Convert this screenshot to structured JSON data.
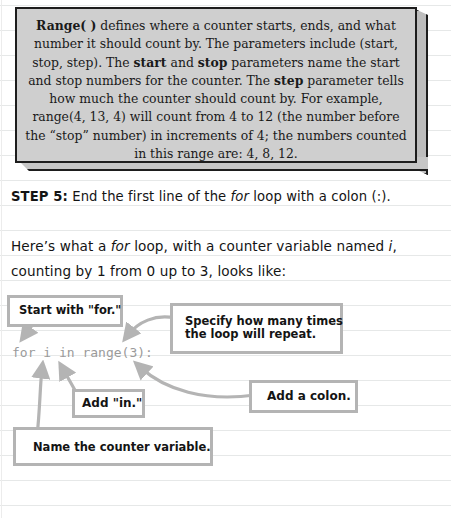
{
  "info_box": {
    "segments": [
      {
        "text": "Range( )",
        "bold": true
      },
      {
        "text": " defines where a counter starts, ends, and what number it should count by. The parameters include (start, stop, step). The ",
        "bold": false
      },
      {
        "text": "start",
        "bold": true
      },
      {
        "text": " and ",
        "bold": false
      },
      {
        "text": "stop",
        "bold": true
      },
      {
        "text": " parameters name the start and stop numbers for the counter. The ",
        "bold": false
      },
      {
        "text": "step",
        "bold": true
      },
      {
        "text": " parameter tells how much the counter should count by. For example, range(4, 13, 4) will count from 4 to 12 (the number before the “stop” number) in increments of 4; the numbers counted in this range are: 4, 8, 12.",
        "bold": false
      }
    ],
    "face_color": "#cfcfcf",
    "border_color": "#1d1d1d"
  },
  "step": {
    "label": "STEP 5:",
    "text_before": " End the first line of the ",
    "keyword": "for",
    "text_after": " loop with a colon (:)."
  },
  "intro": {
    "line1_before": "Here’s what a ",
    "line1_keyword": "for",
    "line1_middle": " loop, with a counter variable named ",
    "line1_var": "i",
    "line1_end": ",",
    "line2": "counting by 1 from 0 up to 3, looks like:"
  },
  "code": {
    "line": "for i in range(3):",
    "color": "#9a9a9a"
  },
  "callouts": {
    "start": "Start with \"for.\"",
    "specify_line1": "Specify how many times",
    "specify_line2": "the loop will repeat.",
    "colon": "Add a colon.",
    "in": "Add \"in.\"",
    "name": "Name the counter variable."
  },
  "colors": {
    "callout_border": "#b4b4b4",
    "arrow": "#b4b4b4",
    "ruled_line": "#e6e8e8"
  }
}
